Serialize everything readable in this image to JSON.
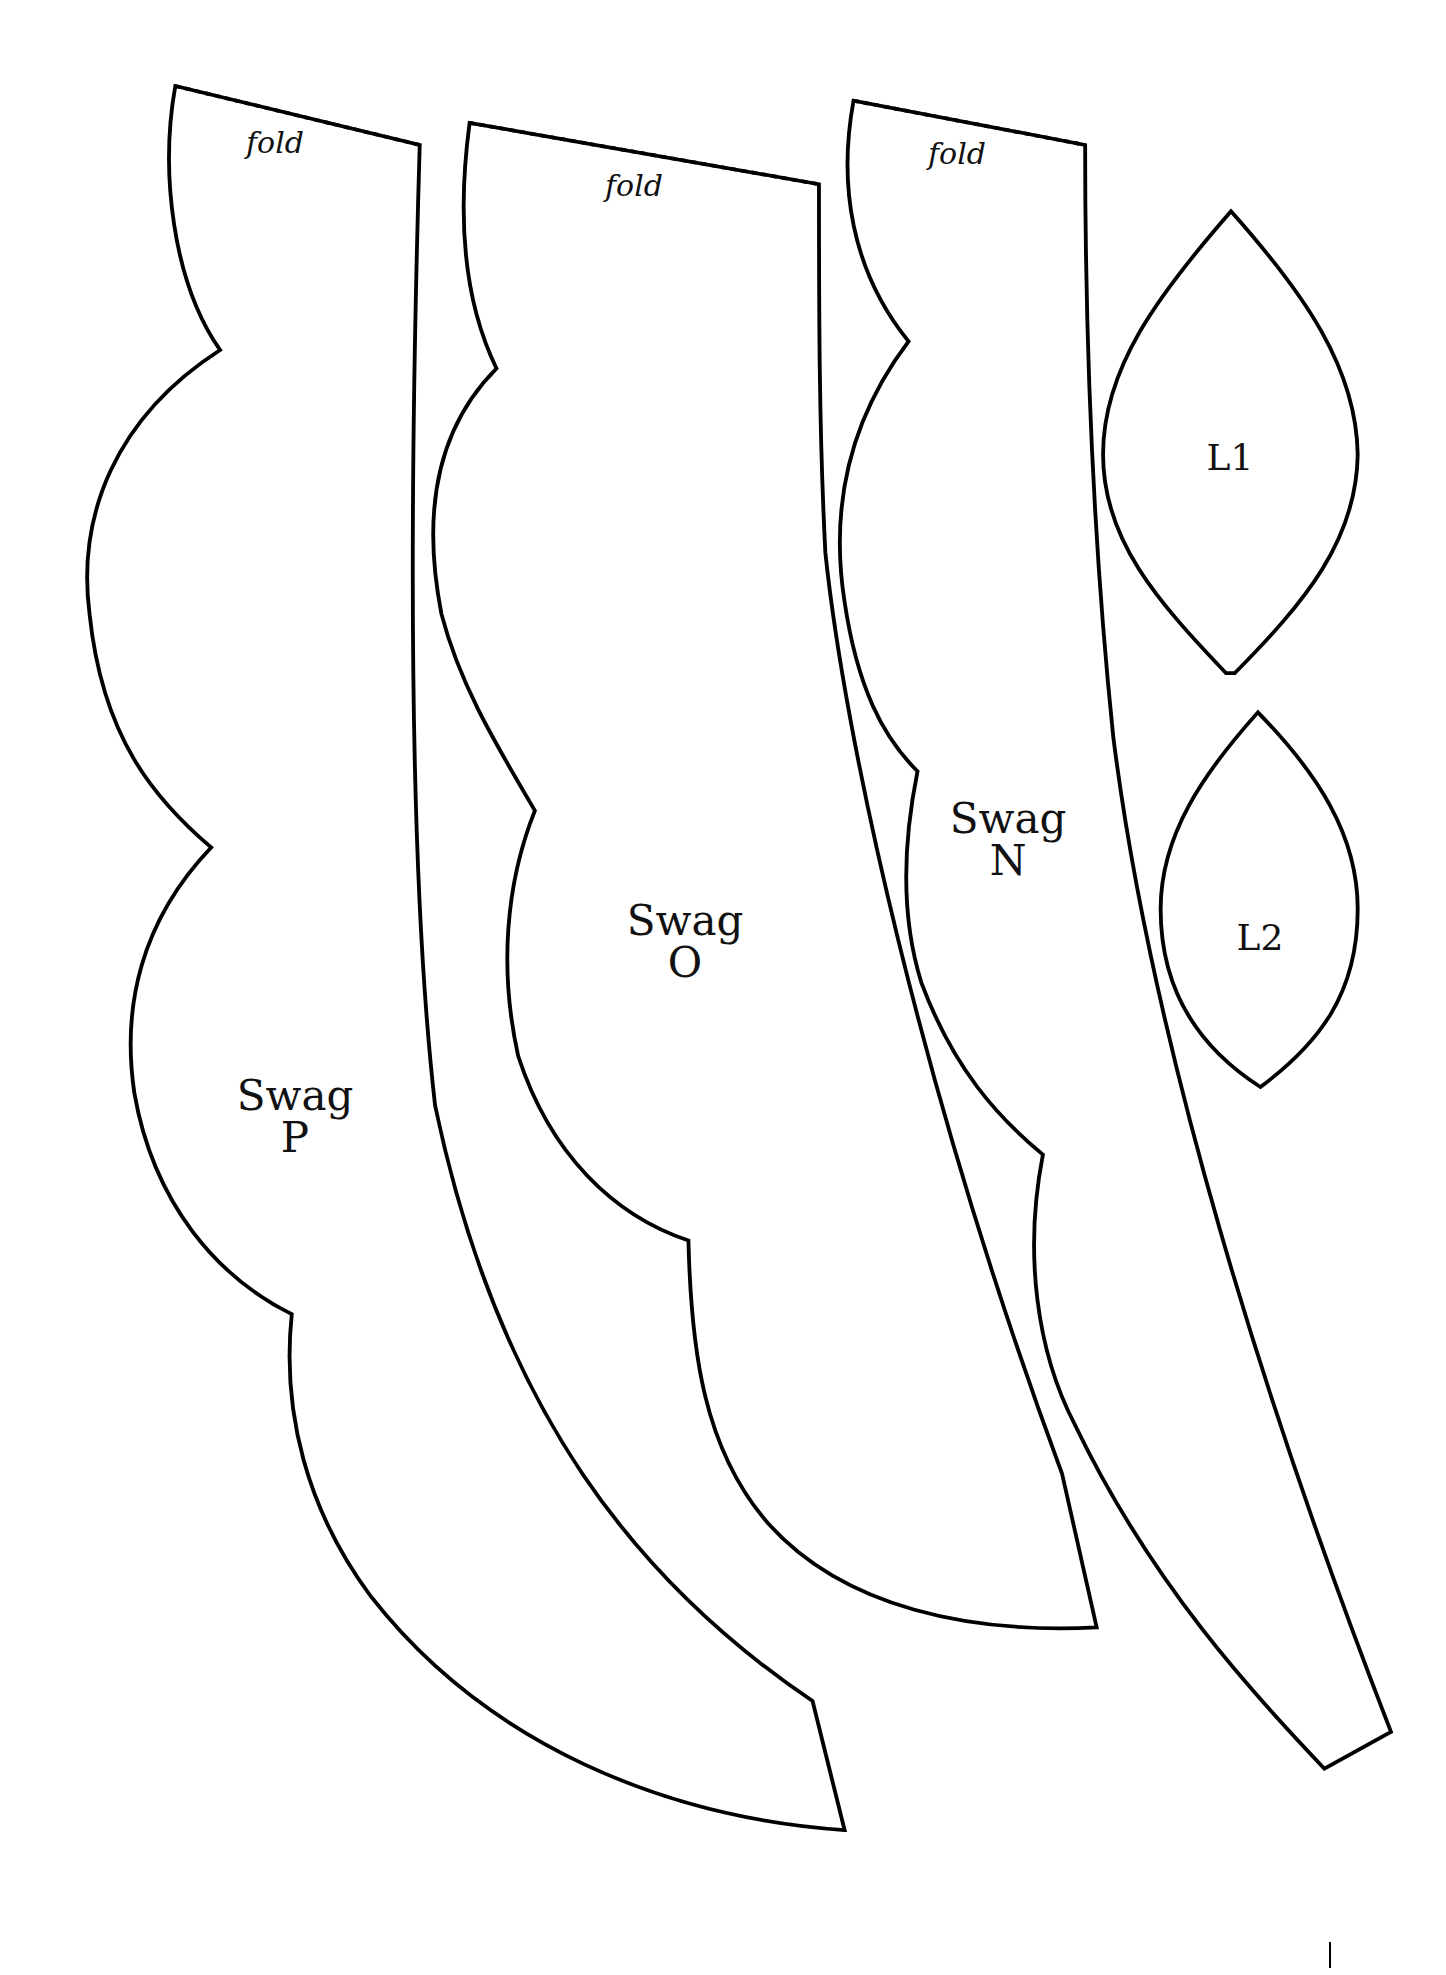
{
  "document": {
    "type": "sewing pattern sheet",
    "pieces": [
      {
        "id": "swag-p",
        "line1": "Swag",
        "line2": "P",
        "fold_label": "fold"
      },
      {
        "id": "swag-o",
        "line1": "Swag",
        "line2": "O",
        "fold_label": "fold"
      },
      {
        "id": "swag-n",
        "line1": "Swag",
        "line2": "N",
        "fold_label": "fold"
      },
      {
        "id": "leaf-1",
        "label": "L1"
      },
      {
        "id": "leaf-2",
        "label": "L2"
      }
    ],
    "colors": {
      "stroke": "#000000",
      "background": "#ffffff"
    }
  }
}
